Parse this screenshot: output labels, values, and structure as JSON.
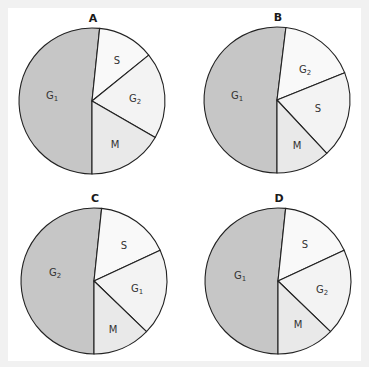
{
  "colors": {
    "G1_large": "#c6c6c6",
    "S": "#f9f9f9",
    "G2": "#f3f3f3",
    "G1_small": "#f3f3f3",
    "M": "#e9e9e9",
    "stroke": "#222222"
  },
  "chart_data": [
    {
      "type": "pie",
      "title": "A",
      "center": [
        92,
        101
      ],
      "radius": 73,
      "slices": [
        {
          "label": "G",
          "sub": "1",
          "start": 180,
          "end": 366,
          "percent": 51.7,
          "fill": "#c6c6c6",
          "label_pos": [
            52,
            96
          ]
        },
        {
          "label": "S",
          "sub": "",
          "start": 6,
          "end": 51,
          "percent": 12.5,
          "fill": "#f9f9f9",
          "label_pos": [
            117,
            61
          ]
        },
        {
          "label": "G",
          "sub": "2",
          "start": 51,
          "end": 120,
          "percent": 19.2,
          "fill": "#f3f3f3",
          "label_pos": [
            135,
            99
          ]
        },
        {
          "label": "M",
          "sub": "",
          "start": 120,
          "end": 180,
          "percent": 16.7,
          "fill": "#e9e9e9",
          "label_pos": [
            115,
            145
          ]
        }
      ]
    },
    {
      "type": "pie",
      "title": "B",
      "center": [
        277,
        100
      ],
      "radius": 73,
      "slices": [
        {
          "label": "G",
          "sub": "1",
          "start": 180,
          "end": 367,
          "percent": 51.9,
          "fill": "#c6c6c6",
          "label_pos": [
            237,
            96
          ]
        },
        {
          "label": "G",
          "sub": "2",
          "start": 7,
          "end": 68,
          "percent": 16.9,
          "fill": "#f9f9f9",
          "label_pos": [
            305,
            70
          ]
        },
        {
          "label": "S",
          "sub": "",
          "start": 68,
          "end": 137,
          "percent": 19.2,
          "fill": "#f3f3f3",
          "label_pos": [
            318,
            109
          ]
        },
        {
          "label": "M",
          "sub": "",
          "start": 137,
          "end": 180,
          "percent": 11.9,
          "fill": "#e9e9e9",
          "label_pos": [
            297,
            146
          ]
        }
      ]
    },
    {
      "type": "pie",
      "title": "C",
      "center": [
        94,
        281
      ],
      "radius": 73,
      "slices": [
        {
          "label": "G",
          "sub": "2",
          "start": 180,
          "end": 366,
          "percent": 51.7,
          "fill": "#c6c6c6",
          "label_pos": [
            55,
            273
          ]
        },
        {
          "label": "S",
          "sub": "",
          "start": 6,
          "end": 65,
          "percent": 16.4,
          "fill": "#f9f9f9",
          "label_pos": [
            124,
            246
          ]
        },
        {
          "label": "G",
          "sub": "1",
          "start": 65,
          "end": 134,
          "percent": 19.2,
          "fill": "#f3f3f3",
          "label_pos": [
            137,
            289
          ]
        },
        {
          "label": "M",
          "sub": "",
          "start": 134,
          "end": 180,
          "percent": 12.8,
          "fill": "#e9e9e9",
          "label_pos": [
            113,
            330
          ]
        }
      ]
    },
    {
      "type": "pie",
      "title": "D",
      "center": [
        278,
        281
      ],
      "radius": 73,
      "slices": [
        {
          "label": "G",
          "sub": "1",
          "start": 180,
          "end": 366,
          "percent": 51.7,
          "fill": "#c6c6c6",
          "label_pos": [
            240,
            276
          ]
        },
        {
          "label": "S",
          "sub": "",
          "start": 6,
          "end": 65,
          "percent": 16.4,
          "fill": "#f9f9f9",
          "label_pos": [
            305,
            245
          ]
        },
        {
          "label": "G",
          "sub": "2",
          "start": 65,
          "end": 134,
          "percent": 19.2,
          "fill": "#f3f3f3",
          "label_pos": [
            322,
            290
          ]
        },
        {
          "label": "M",
          "sub": "",
          "start": 134,
          "end": 180,
          "percent": 12.8,
          "fill": "#e9e9e9",
          "label_pos": [
            298,
            325
          ]
        }
      ]
    }
  ]
}
